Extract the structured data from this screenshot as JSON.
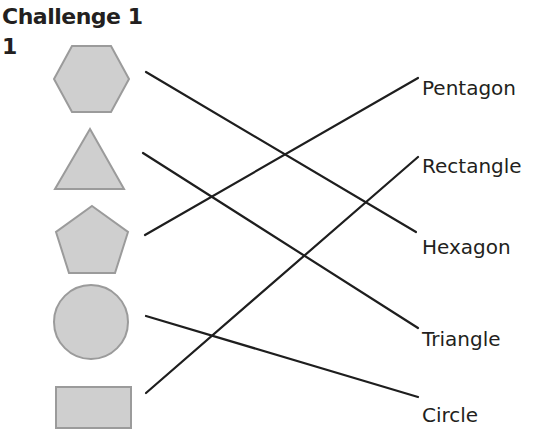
{
  "header": {
    "title": "Challenge 1",
    "question_number": "1"
  },
  "shapes": [
    {
      "id": "hexagon",
      "name": "hexagon"
    },
    {
      "id": "triangle",
      "name": "triangle"
    },
    {
      "id": "pentagon",
      "name": "pentagon"
    },
    {
      "id": "circle",
      "name": "circle"
    },
    {
      "id": "rectangle",
      "name": "rectangle"
    }
  ],
  "labels": [
    {
      "text": "Pentagon"
    },
    {
      "text": "Rectangle"
    },
    {
      "text": "Hexagon"
    },
    {
      "text": "Triangle"
    },
    {
      "text": "Circle"
    }
  ],
  "matches": [
    {
      "shape": "hexagon",
      "label": "Hexagon"
    },
    {
      "shape": "triangle",
      "label": "Triangle"
    },
    {
      "shape": "pentagon",
      "label": "Pentagon"
    },
    {
      "shape": "circle",
      "label": "Circle"
    },
    {
      "shape": "rectangle",
      "label": "Rectangle"
    }
  ],
  "colors": {
    "shape_fill": "#cfcfcf",
    "shape_stroke": "#9b9b9b",
    "line": "#1e1e1e",
    "text": "#231f20"
  }
}
